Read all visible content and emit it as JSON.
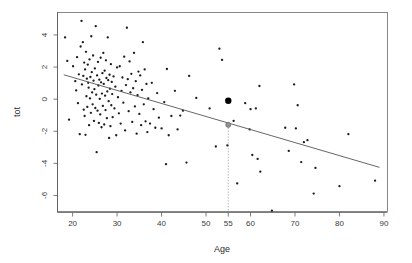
{
  "chart_data": {
    "type": "scatter",
    "title": "",
    "xlabel": "Age",
    "ylabel": "tot",
    "xlim": [
      16.6,
      90.8
    ],
    "ylim": [
      -7.0,
      5.4
    ],
    "grid": false,
    "legend": null,
    "xticks": [
      20,
      30,
      40,
      50,
      55,
      60,
      70,
      80,
      90
    ],
    "xtick_labels": [
      "20",
      "30",
      "40",
      "50",
      "55",
      "60",
      "70",
      "80",
      "90"
    ],
    "yticks": [
      4,
      2,
      0,
      -2,
      -4,
      -6
    ],
    "ytick_labels": [
      "4",
      "2",
      "0",
      "-2",
      "-4",
      "-6"
    ],
    "fit_line": {
      "name": "linear regression",
      "x": [
        18.0,
        89.0
      ],
      "y": [
        1.52,
        -4.25
      ],
      "slope": -0.0813,
      "intercept": 2.983
    },
    "annotations": [
      {
        "name": "highlighted-observation",
        "marker": "large-filled-circle",
        "x": 55,
        "y": -0.1,
        "color": "#000000"
      },
      {
        "name": "fitted-value-at-age-55",
        "marker": "gray-ring-circle",
        "x": 55,
        "y": -1.6,
        "color": "#8f8f8f"
      },
      {
        "name": "dropline-at-age-55",
        "type": "vertical-dotted-line",
        "x": 55,
        "y_from": -1.6,
        "y_to": -7.0,
        "color": "#9a9a9a"
      }
    ],
    "points": [
      [
        18.3,
        3.85
      ],
      [
        18.8,
        2.38
      ],
      [
        19.2,
        -1.28
      ],
      [
        20.1,
        2.05
      ],
      [
        20.6,
        1.12
      ],
      [
        20.8,
        0.55
      ],
      [
        21.0,
        2.62
      ],
      [
        21.2,
        -0.25
      ],
      [
        21.4,
        1.55
      ],
      [
        21.6,
        -2.18
      ],
      [
        21.8,
        3.28
      ],
      [
        22.0,
        4.88
      ],
      [
        22.1,
        0.92
      ],
      [
        22.3,
        3.55
      ],
      [
        22.4,
        1.45
      ],
      [
        22.5,
        -0.65
      ],
      [
        22.6,
        2.28
      ],
      [
        22.7,
        -1.05
      ],
      [
        22.8,
        1.85
      ],
      [
        22.9,
        -2.22
      ],
      [
        23.0,
        2.95
      ],
      [
        23.1,
        0.18
      ],
      [
        23.2,
        1.28
      ],
      [
        23.3,
        -0.48
      ],
      [
        23.4,
        2.15
      ],
      [
        23.5,
        1.02
      ],
      [
        23.6,
        0.72
      ],
      [
        23.7,
        -1.62
      ],
      [
        23.8,
        2.48
      ],
      [
        23.9,
        0.05
      ],
      [
        24.0,
        1.38
      ],
      [
        24.1,
        -0.85
      ],
      [
        24.2,
        3.92
      ],
      [
        24.3,
        1.68
      ],
      [
        24.4,
        0.42
      ],
      [
        24.5,
        -0.32
      ],
      [
        24.6,
        2.72
      ],
      [
        24.7,
        1.15
      ],
      [
        24.8,
        -1.35
      ],
      [
        24.9,
        0.62
      ],
      [
        25.0,
        1.92
      ],
      [
        25.1,
        -0.55
      ],
      [
        25.2,
        4.55
      ],
      [
        25.3,
        0.28
      ],
      [
        25.4,
        -3.3
      ],
      [
        25.5,
        1.48
      ],
      [
        25.6,
        -0.72
      ],
      [
        25.7,
        2.32
      ],
      [
        25.8,
        0.85
      ],
      [
        25.9,
        -1.48
      ],
      [
        26.0,
        1.22
      ],
      [
        26.1,
        0.02
      ],
      [
        26.2,
        -0.95
      ],
      [
        26.3,
        2.58
      ],
      [
        26.4,
        1.05
      ],
      [
        26.5,
        -1.75
      ],
      [
        26.6,
        0.35
      ],
      [
        26.7,
        1.62
      ],
      [
        26.8,
        -0.42
      ],
      [
        26.9,
        2.88
      ],
      [
        27.0,
        0.95
      ],
      [
        27.1,
        -1.58
      ],
      [
        27.2,
        1.78
      ],
      [
        27.3,
        0.22
      ],
      [
        27.4,
        -0.68
      ],
      [
        27.5,
        2.42
      ],
      [
        27.6,
        1.32
      ],
      [
        27.7,
        -1.18
      ],
      [
        27.8,
        0.48
      ],
      [
        27.9,
        3.85
      ],
      [
        28.0,
        1.18
      ],
      [
        28.1,
        -0.12
      ],
      [
        28.2,
        -2.42
      ],
      [
        28.3,
        1.52
      ],
      [
        28.4,
        0.65
      ],
      [
        28.5,
        -1.68
      ],
      [
        28.6,
        2.18
      ],
      [
        28.7,
        -0.38
      ],
      [
        28.8,
        1.08
      ],
      [
        28.9,
        0.32
      ],
      [
        29.0,
        -1.12
      ],
      [
        29.2,
        1.42
      ],
      [
        29.4,
        -0.58
      ],
      [
        29.6,
        0.78
      ],
      [
        29.8,
        -2.25
      ],
      [
        30.0,
        1.98
      ],
      [
        30.2,
        0.12
      ],
      [
        30.4,
        -0.88
      ],
      [
        30.6,
        2.05
      ],
      [
        30.8,
        -1.52
      ],
      [
        31.0,
        0.52
      ],
      [
        31.2,
        1.35
      ],
      [
        31.4,
        -0.22
      ],
      [
        31.6,
        2.65
      ],
      [
        31.8,
        -1.95
      ],
      [
        32.0,
        0.88
      ],
      [
        32.2,
        4.45
      ],
      [
        32.4,
        1.25
      ],
      [
        32.6,
        -0.75
      ],
      [
        32.8,
        2.35
      ],
      [
        33.0,
        0.42
      ],
      [
        33.2,
        1.58
      ],
      [
        33.4,
        -1.42
      ],
      [
        33.6,
        0.68
      ],
      [
        33.8,
        2.88
      ],
      [
        34.0,
        -0.45
      ],
      [
        34.2,
        1.12
      ],
      [
        34.4,
        -2.15
      ],
      [
        34.6,
        0.25
      ],
      [
        34.8,
        1.72
      ],
      [
        35.0,
        -0.92
      ],
      [
        35.2,
        1.48
      ],
      [
        35.4,
        -1.62
      ],
      [
        35.6,
        0.58
      ],
      [
        35.8,
        3.55
      ],
      [
        36.0,
        -0.32
      ],
      [
        36.2,
        1.85
      ],
      [
        36.4,
        -1.38
      ],
      [
        36.6,
        0.95
      ],
      [
        36.8,
        -2.05
      ],
      [
        37.0,
        0.05
      ],
      [
        37.4,
        -1.52
      ],
      [
        37.8,
        1.02
      ],
      [
        38.2,
        -0.62
      ],
      [
        38.6,
        -1.78
      ],
      [
        39.0,
        0.38
      ],
      [
        39.4,
        -1.15
      ],
      [
        40.0,
        -1.82
      ],
      [
        40.6,
        -0.18
      ],
      [
        41.0,
        -4.05
      ],
      [
        41.2,
        1.88
      ],
      [
        41.6,
        -2.25
      ],
      [
        42.2,
        -1.05
      ],
      [
        43.0,
        0.52
      ],
      [
        43.6,
        -1.88
      ],
      [
        44.2,
        -1.02
      ],
      [
        44.8,
        -0.72
      ],
      [
        45.6,
        -3.95
      ],
      [
        46.2,
        1.45
      ],
      [
        47.8,
        0.08
      ],
      [
        50.8,
        -0.58
      ],
      [
        52.2,
        -2.95
      ],
      [
        53.0,
        3.15
      ],
      [
        53.6,
        2.45
      ],
      [
        54.8,
        -2.88
      ],
      [
        56.2,
        -1.35
      ],
      [
        57.0,
        -5.25
      ],
      [
        58.8,
        -0.25
      ],
      [
        59.8,
        -1.88
      ],
      [
        60.0,
        -0.62
      ],
      [
        60.4,
        -3.48
      ],
      [
        61.2,
        -0.58
      ],
      [
        61.6,
        -3.72
      ],
      [
        62.0,
        0.82
      ],
      [
        62.2,
        -4.52
      ],
      [
        64.8,
        -6.95
      ],
      [
        67.8,
        -1.78
      ],
      [
        68.6,
        -3.22
      ],
      [
        69.8,
        0.92
      ],
      [
        70.2,
        -1.82
      ],
      [
        70.6,
        -0.38
      ],
      [
        71.4,
        -3.92
      ],
      [
        72.0,
        -2.68
      ],
      [
        72.8,
        -2.55
      ],
      [
        74.2,
        -5.88
      ],
      [
        74.6,
        -4.28
      ],
      [
        80.0,
        -5.42
      ],
      [
        82.0,
        -2.18
      ],
      [
        88.0,
        -5.08
      ]
    ]
  },
  "labels": {
    "xlabel": "Age",
    "ylabel": "tot"
  }
}
